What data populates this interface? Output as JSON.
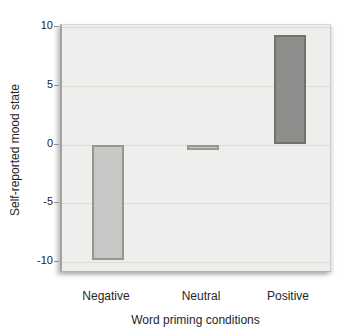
{
  "chart_data": {
    "type": "bar",
    "categories": [
      "Negative",
      "Neutral",
      "Positive"
    ],
    "values": [
      -9.8,
      -0.4,
      9.3
    ],
    "title": "",
    "xlabel": "Word priming conditions",
    "ylabel": "Self-reported mood state",
    "ylim": [
      -10,
      10
    ],
    "yticks": [
      10,
      5,
      0,
      -5,
      -10
    ],
    "grid": true,
    "legend": false,
    "colors": {
      "panel_bg": "#efeeec",
      "gridline": "#dcdbd8",
      "text": "#262626",
      "light_bar_fill": "#c8c7c5",
      "light_bar_border": "#97968f",
      "dark_bar_fill": "#8f8e8c",
      "dark_bar_border": "#72716c"
    },
    "bar_styles": [
      {
        "fill": "#c8c7c5",
        "border": "#97968f"
      },
      {
        "fill": "#c8c7c5",
        "border": "#97968f"
      },
      {
        "fill": "#8f8e8c",
        "border": "#72716c"
      }
    ]
  }
}
